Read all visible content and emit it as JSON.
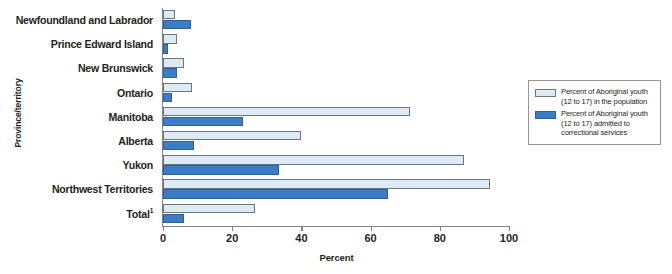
{
  "chart_data": {
    "type": "bar",
    "orientation": "horizontal",
    "title": "",
    "xlabel": "Percent",
    "ylabel": "Province/territory",
    "xlim": [
      0,
      100
    ],
    "xticks": [
      0,
      20,
      40,
      60,
      80,
      100
    ],
    "grid": false,
    "legend_position": "right",
    "categories": [
      "Newfoundland and Labrador",
      "Prince Edward Island",
      "New Brunswick",
      "Ontario",
      "Manitoba",
      "Alberta",
      "Yukon",
      "Northwest Territories",
      "Total"
    ],
    "category_footnotes": [
      "",
      "",
      "",
      "",
      "",
      "",
      "",
      "",
      "1"
    ],
    "series": [
      {
        "name": "Percent of Aboriginal youth (12 to 17) in the population",
        "color": "#dcebf7",
        "values": [
          3.5,
          4,
          6,
          8.5,
          71.5,
          40,
          87,
          94.5,
          26.5
        ]
      },
      {
        "name": "Percent of Aboriginal youth (12 to 17) admitted to correctional services",
        "color": "#3b7cc4",
        "values": [
          8,
          1.5,
          4,
          2.5,
          23,
          9,
          33.5,
          65,
          6
        ]
      }
    ]
  },
  "axes": {
    "y_title": "Province/territory",
    "x_title": "Percent",
    "x_tick_labels": [
      "0",
      "20",
      "40",
      "60",
      "80",
      "100"
    ]
  },
  "legend": {
    "items": [
      {
        "swatch": "light",
        "label": "Percent of Aboriginal youth (12 to 17) in the population"
      },
      {
        "swatch": "dark",
        "label": "Percent of Aboriginal youth (12 to 17) admitted to correctional services"
      }
    ]
  }
}
